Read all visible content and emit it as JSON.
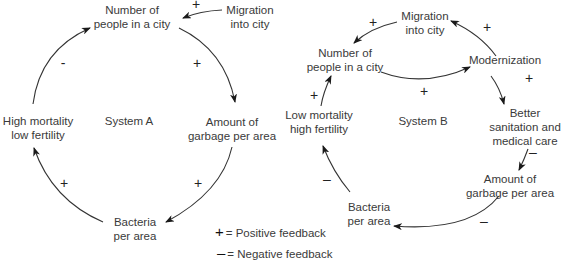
{
  "system_a": {
    "title": "System  A",
    "nodes": {
      "people_l1": "Number of",
      "people_l2": "people in a city",
      "migration_l1": "Migration",
      "migration_l2": "into city",
      "garbage_l1": "Amount of",
      "garbage_l2": "garbage per area",
      "bacteria_l1": "Bacteria",
      "bacteria_l2": "per area",
      "mortality_l1": "High mortality",
      "mortality_l2": "low fertility"
    },
    "signs": {
      "migration_to_people": "+",
      "people_to_garbage": "+",
      "garbage_to_bacteria": "+",
      "bacteria_to_mortality": "+",
      "mortality_to_people": "-"
    }
  },
  "system_b": {
    "title": "System  B",
    "nodes": {
      "migration_l1": "Migration",
      "migration_l2": "into city",
      "people_l1": "Number of",
      "people_l2": "people in a city",
      "modernization": "Modernization",
      "sanitation_l1": "Better",
      "sanitation_l2": "sanitation and",
      "sanitation_l3": "medical care",
      "garbage_l1": "Amount of",
      "garbage_l2": "garbage per area",
      "bacteria_l1": "Bacteria",
      "bacteria_l2": "per area",
      "mortality_l1": "Low mortality",
      "mortality_l2": "high fertility"
    },
    "signs": {
      "migration_to_people": "+",
      "modernization_to_migration": "+",
      "people_to_modernization": "+",
      "modernization_to_sanitation": "+",
      "sanitation_to_garbage": "–",
      "garbage_to_bacteria": "–",
      "bacteria_to_mortality": "–",
      "mortality_to_people": "+"
    }
  },
  "legend": {
    "positive_symbol": "+",
    "positive_label": "= Positive feedback",
    "negative_symbol": "–",
    "negative_label": "= Negative feedback"
  }
}
